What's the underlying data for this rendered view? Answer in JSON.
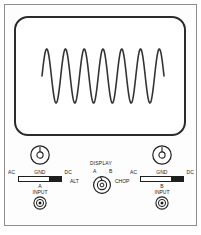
{
  "diagram": {
    "colors": {
      "ink": "#1e1e1e",
      "frame": "#8e8e8e",
      "bezel": "#2b2b2b",
      "trace": "#333333",
      "panel_bg": "#fdfdfd"
    }
  },
  "screen": {
    "name": "crt-display",
    "waveform": {
      "type": "sine",
      "cycles": 6.5,
      "description": "continuous sine wave trace"
    }
  },
  "channel_a": {
    "knob_name": "volts-per-division-knob-a",
    "coupling": {
      "options": [
        "AC",
        "GND",
        "DC"
      ],
      "ac_label": "AC",
      "gnd_label": "GND",
      "dc_label": "DC",
      "selected": "DC"
    },
    "channel_letter": "A",
    "input_label": "INPUT",
    "connector_name": "bnc-connector-a"
  },
  "channel_b": {
    "knob_name": "volts-per-division-knob-b",
    "coupling": {
      "options": [
        "AC",
        "GND",
        "DC"
      ],
      "ac_label": "AC",
      "gnd_label": "GND",
      "dc_label": "DC",
      "selected": "DC"
    },
    "channel_letter": "B",
    "input_label": "INPUT",
    "connector_name": "bnc-connector-b"
  },
  "display_selector": {
    "title": "DISPLAY",
    "positions": [
      "ALT",
      "A",
      "B",
      "CHOP"
    ],
    "alt_label": "ALT",
    "a_label": "A",
    "b_label": "B",
    "chop_label": "CHOP",
    "selected": "A"
  },
  "chart_data": {
    "type": "line",
    "title": "",
    "xlabel": "",
    "ylabel": "",
    "xlim": [
      0,
      6.5
    ],
    "ylim": [
      -1,
      1
    ],
    "grid": false,
    "series": [
      {
        "name": "sine-trace",
        "cycles": 6.5,
        "amplitude": 1,
        "phase_start": 0,
        "points_hint": "y = sin(2*pi*x), x from 0 to 6.5"
      }
    ]
  }
}
